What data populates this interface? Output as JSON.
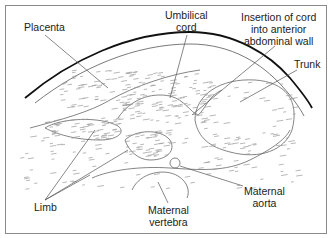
{
  "figure": {
    "type": "ultrasound-style anatomical cross-section sketch",
    "labels": {
      "placenta": [
        "Placenta"
      ],
      "umbilical_cord": [
        "Umbilical",
        "cord"
      ],
      "insertion": [
        "Insertion of cord",
        "into anterior",
        "abdominal wall"
      ],
      "trunk": [
        "Trunk"
      ],
      "limb": [
        "Limb"
      ],
      "maternal_aorta": [
        "Maternal",
        "aorta"
      ],
      "maternal_vertebra": [
        "Maternal",
        "vertebra"
      ]
    },
    "colors": {
      "background": "#ffffff",
      "line": "#111111",
      "texture": "#9a9a9a"
    }
  }
}
